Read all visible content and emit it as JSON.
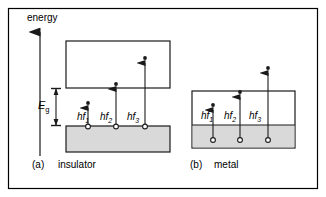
{
  "figure": {
    "axis_label": "energy",
    "gap_label": "E",
    "gap_label_sub": "g",
    "border_color": "#000000",
    "band_fill_color": "#d9d9d9",
    "line_color": "#1a1a1a"
  },
  "panels": [
    {
      "tag": "(a)",
      "name": "insulator",
      "transitions": [
        {
          "label": "hf",
          "sub": "1"
        },
        {
          "label": "hf",
          "sub": "2"
        },
        {
          "label": "hf",
          "sub": "3"
        }
      ]
    },
    {
      "tag": "(b)",
      "name": "metal",
      "transitions": [
        {
          "label": "hf",
          "sub": "1"
        },
        {
          "label": "hf",
          "sub": "2"
        },
        {
          "label": "hf",
          "sub": "3"
        }
      ]
    }
  ]
}
